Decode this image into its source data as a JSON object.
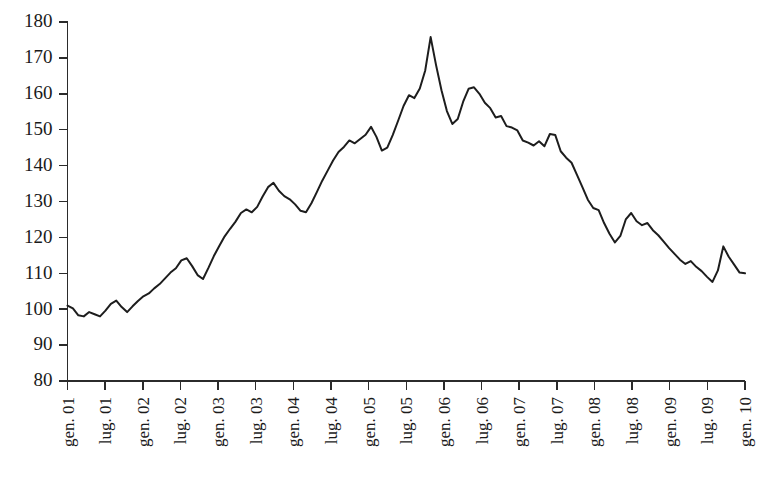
{
  "chart_data": {
    "type": "line",
    "title": "",
    "subtitle": "",
    "xlabel": "",
    "ylabel": "",
    "grid": false,
    "legend": false,
    "legend_position": "none",
    "ylim": [
      80,
      180
    ],
    "y_ticks": [
      80,
      90,
      100,
      110,
      120,
      130,
      140,
      150,
      160,
      170,
      180
    ],
    "y_tick_labels": [
      "80",
      "90",
      "100",
      "110",
      "120",
      "130",
      "140",
      "150",
      "160",
      "170",
      "180"
    ],
    "x_tick_labels": [
      "gen. 01",
      "lug. 01",
      "gen. 02",
      "lug. 02",
      "gen. 03",
      "lug. 03",
      "gen. 04",
      "lug. 04",
      "gen. 05",
      "lug. 05",
      "gen. 06",
      "lug. 06",
      "gen. 07",
      "lug. 07",
      "gen. 08",
      "lug. 08",
      "gen. 09",
      "lug. 09",
      "gen. 10"
    ],
    "x_tick_months": [
      0,
      6,
      12,
      18,
      24,
      30,
      36,
      42,
      48,
      54,
      60,
      66,
      72,
      78,
      84,
      90,
      96,
      102,
      108
    ],
    "x_label_rotation": -90,
    "x_start_label": "gen. 01",
    "x_end_label": "gen. 10",
    "line_color": "#1d1d1d",
    "axis_color": "#2b2b2b",
    "background_color": "#ffffff",
    "series": [
      {
        "name": "indice",
        "values": [
          101.0,
          100.2,
          98.3,
          98.0,
          99.2,
          98.6,
          98.0,
          99.6,
          101.5,
          102.4,
          100.6,
          99.2,
          100.8,
          102.3,
          103.6,
          104.4,
          105.8,
          107.0,
          108.6,
          110.2,
          111.4,
          113.6,
          114.2,
          112.0,
          109.5,
          108.4,
          111.5,
          114.8,
          117.6,
          120.3,
          122.4,
          124.4,
          126.8,
          127.8,
          127.0,
          128.5,
          131.4,
          134.0,
          135.2,
          133.0,
          131.5,
          130.6,
          129.2,
          127.4,
          127.0,
          129.5,
          132.6,
          135.8,
          138.6,
          141.4,
          143.8,
          145.2,
          147.0,
          146.2,
          147.4,
          148.6,
          150.8,
          148.0,
          144.2,
          145.0,
          148.5,
          152.5,
          156.6,
          159.6,
          158.8,
          161.5,
          166.5,
          175.8,
          168.0,
          161.0,
          155.2,
          151.6,
          153.0,
          157.8,
          161.4,
          161.8,
          160.0,
          157.5,
          156.0,
          153.4,
          153.8,
          151.0,
          150.6,
          149.8,
          147.0,
          146.4,
          145.6,
          146.8,
          145.4,
          148.8,
          148.5,
          144.0,
          142.2,
          140.8,
          137.4,
          134.0,
          130.5,
          128.2,
          127.6,
          124.0,
          121.0,
          118.6,
          120.4,
          125.0,
          126.8,
          124.5,
          123.4,
          124.0,
          122.0,
          120.6,
          118.8,
          117.0,
          115.4,
          113.8,
          112.6,
          113.4,
          111.8,
          110.6,
          109.0,
          107.6,
          110.8,
          117.5,
          114.6,
          112.4,
          110.2,
          110.0
        ]
      }
    ],
    "n_points": 127,
    "peak_value": 175.8,
    "peak_label": "lug. 05",
    "start_value": 101.0,
    "end_value": 110.0,
    "min_value": 98.0
  }
}
